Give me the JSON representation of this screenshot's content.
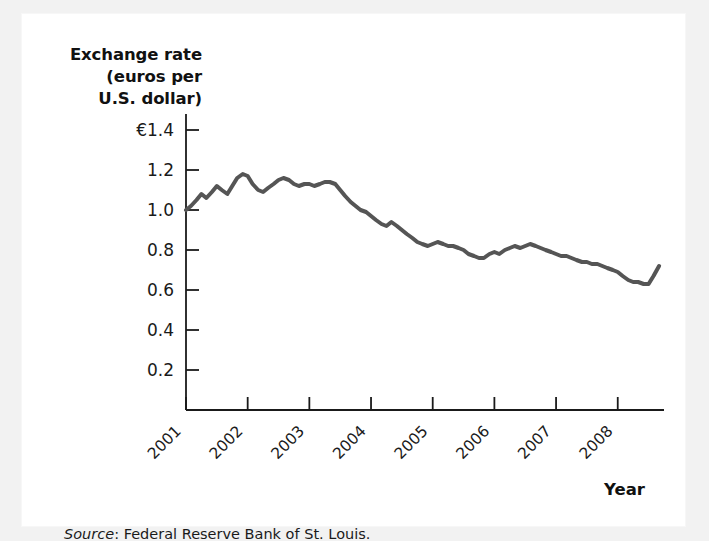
{
  "figure": {
    "background_color": "#f2f2f2",
    "plate_color": "#ffffff",
    "source_prefix": "Source",
    "source_separator": ": ",
    "source_text": "Federal Reserve Bank of St. Louis."
  },
  "axis_titles": {
    "y_line1": "Exchange rate",
    "y_line2": "(euros per",
    "y_line3": "U.S. dollar)",
    "x": "Year"
  },
  "chart_data": {
    "type": "line",
    "title": "",
    "xlabel": "Year",
    "ylabel": "Exchange rate (euros per U.S. dollar)",
    "ylim": [
      0,
      1.48
    ],
    "xlim": [
      2001,
      2008.75
    ],
    "grid": false,
    "legend": null,
    "line_color": "#555555",
    "line_width": 4,
    "y_ticks": [
      0.2,
      0.4,
      0.6,
      0.8,
      1.0,
      1.2,
      1.4
    ],
    "y_tick_labels": [
      "0.2",
      "0.4",
      "0.6",
      "0.8",
      "1.0",
      "1.2",
      "€1.4"
    ],
    "x_ticks": [
      2001,
      2002,
      2003,
      2004,
      2005,
      2006,
      2007,
      2008
    ],
    "x_tick_labels": [
      "2001",
      "2002",
      "2003",
      "2004",
      "2005",
      "2006",
      "2007",
      "2008"
    ],
    "x_tick_rotation": 45,
    "currency_symbol": "€",
    "series": [
      {
        "name": "Euros per U.S. dollar",
        "x": [
          2001.0,
          2001.08,
          2001.17,
          2001.25,
          2001.33,
          2001.42,
          2001.5,
          2001.58,
          2001.67,
          2001.75,
          2001.83,
          2001.92,
          2002.0,
          2002.08,
          2002.17,
          2002.25,
          2002.33,
          2002.42,
          2002.5,
          2002.58,
          2002.67,
          2002.75,
          2002.83,
          2002.92,
          2003.0,
          2003.08,
          2003.17,
          2003.25,
          2003.33,
          2003.42,
          2003.5,
          2003.58,
          2003.67,
          2003.75,
          2003.83,
          2003.92,
          2004.0,
          2004.08,
          2004.17,
          2004.25,
          2004.33,
          2004.42,
          2004.5,
          2004.58,
          2004.67,
          2004.75,
          2004.83,
          2004.92,
          2005.0,
          2005.08,
          2005.17,
          2005.25,
          2005.33,
          2005.42,
          2005.5,
          2005.58,
          2005.67,
          2005.75,
          2005.83,
          2005.92,
          2006.0,
          2006.08,
          2006.17,
          2006.25,
          2006.33,
          2006.42,
          2006.5,
          2006.58,
          2006.67,
          2006.75,
          2006.83,
          2006.92,
          2007.0,
          2007.08,
          2007.17,
          2007.25,
          2007.33,
          2007.42,
          2007.5,
          2007.58,
          2007.67,
          2007.75,
          2007.83,
          2007.92,
          2008.0,
          2008.08,
          2008.17,
          2008.25,
          2008.33,
          2008.42,
          2008.5,
          2008.58,
          2008.67
        ],
        "values": [
          1.0,
          1.02,
          1.05,
          1.08,
          1.06,
          1.09,
          1.12,
          1.1,
          1.08,
          1.12,
          1.16,
          1.18,
          1.17,
          1.13,
          1.1,
          1.09,
          1.11,
          1.13,
          1.15,
          1.16,
          1.15,
          1.13,
          1.12,
          1.13,
          1.13,
          1.12,
          1.13,
          1.14,
          1.14,
          1.13,
          1.1,
          1.07,
          1.04,
          1.02,
          1.0,
          0.99,
          0.97,
          0.95,
          0.93,
          0.92,
          0.94,
          0.92,
          0.9,
          0.88,
          0.86,
          0.84,
          0.83,
          0.82,
          0.83,
          0.84,
          0.83,
          0.82,
          0.82,
          0.81,
          0.8,
          0.78,
          0.77,
          0.76,
          0.76,
          0.78,
          0.79,
          0.78,
          0.8,
          0.81,
          0.82,
          0.81,
          0.82,
          0.83,
          0.82,
          0.81,
          0.8,
          0.79,
          0.78,
          0.77,
          0.77,
          0.76,
          0.75,
          0.74,
          0.74,
          0.73,
          0.73,
          0.72,
          0.71,
          0.7,
          0.69,
          0.67,
          0.65,
          0.64,
          0.64,
          0.63,
          0.63,
          0.67,
          0.72
        ]
      }
    ]
  }
}
